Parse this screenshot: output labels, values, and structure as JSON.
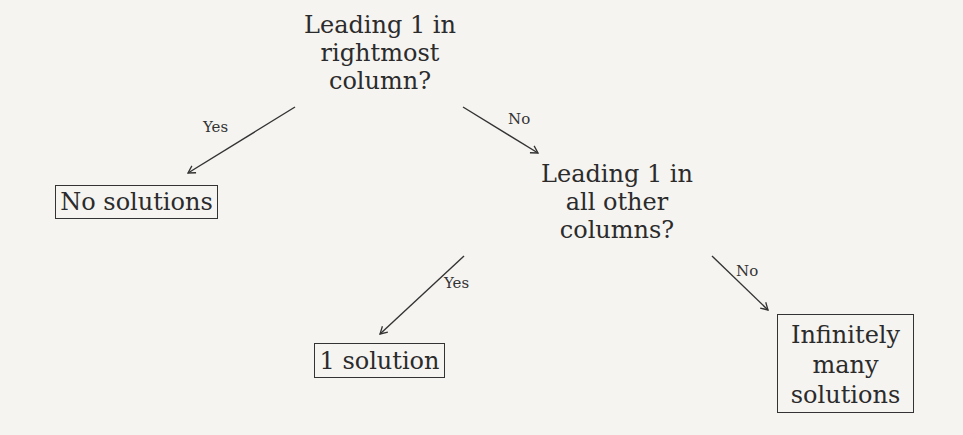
{
  "diagram": {
    "type": "decision-tree",
    "nodes": {
      "q1": {
        "lines": [
          "Leading 1 in",
          "rightmost",
          "column?"
        ]
      },
      "q2": {
        "lines": [
          "Leading 1 in",
          "all other",
          "columns?"
        ]
      },
      "no_solutions": {
        "lines": [
          "No solutions"
        ]
      },
      "one_solution": {
        "lines": [
          "1 solution"
        ]
      },
      "infinite": {
        "lines": [
          "Infinitely",
          "many",
          "solutions"
        ]
      }
    },
    "edges": [
      {
        "from": "q1",
        "to": "no_solutions",
        "label": "Yes"
      },
      {
        "from": "q1",
        "to": "q2",
        "label": "No"
      },
      {
        "from": "q2",
        "to": "one_solution",
        "label": "Yes"
      },
      {
        "from": "q2",
        "to": "infinite",
        "label": "No"
      }
    ]
  },
  "colors": {
    "background": "#f5f4f1",
    "ink": "#2b2b2b"
  }
}
